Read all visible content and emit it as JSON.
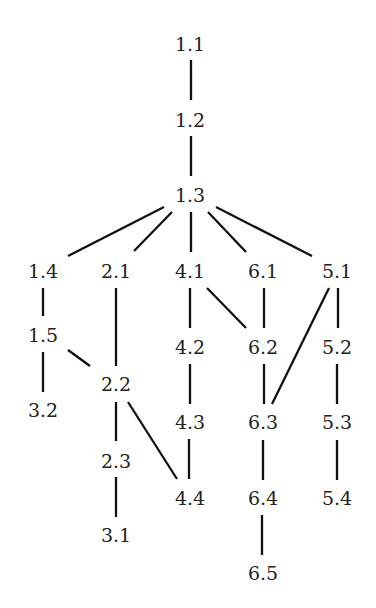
{
  "diagram": {
    "type": "hasse-diagram",
    "colors": {
      "line": "#111111",
      "text": "#222222",
      "background": "#ffffff"
    },
    "nodes": [
      {
        "id": "1.1",
        "label": "1.1",
        "x": 190,
        "y": 44
      },
      {
        "id": "1.2",
        "label": "1.2",
        "x": 190,
        "y": 120
      },
      {
        "id": "1.3",
        "label": "1.3",
        "x": 190,
        "y": 195
      },
      {
        "id": "1.4",
        "label": "1.4",
        "x": 43,
        "y": 271
      },
      {
        "id": "2.1",
        "label": "2.1",
        "x": 116,
        "y": 271
      },
      {
        "id": "4.1",
        "label": "4.1",
        "x": 190,
        "y": 271
      },
      {
        "id": "6.1",
        "label": "6.1",
        "x": 263,
        "y": 271
      },
      {
        "id": "5.1",
        "label": "5.1",
        "x": 337,
        "y": 271
      },
      {
        "id": "1.5",
        "label": "1.5",
        "x": 43,
        "y": 335
      },
      {
        "id": "4.2",
        "label": "4.2",
        "x": 190,
        "y": 347
      },
      {
        "id": "6.2",
        "label": "6.2",
        "x": 263,
        "y": 347
      },
      {
        "id": "5.2",
        "label": "5.2",
        "x": 337,
        "y": 347
      },
      {
        "id": "2.2",
        "label": "2.2",
        "x": 116,
        "y": 384
      },
      {
        "id": "3.2",
        "label": "3.2",
        "x": 43,
        "y": 410
      },
      {
        "id": "4.3",
        "label": "4.3",
        "x": 190,
        "y": 422
      },
      {
        "id": "6.3",
        "label": "6.3",
        "x": 263,
        "y": 422
      },
      {
        "id": "5.3",
        "label": "5.3",
        "x": 337,
        "y": 422
      },
      {
        "id": "2.3",
        "label": "2.3",
        "x": 116,
        "y": 461
      },
      {
        "id": "4.4",
        "label": "4.4",
        "x": 190,
        "y": 498
      },
      {
        "id": "6.4",
        "label": "6.4",
        "x": 263,
        "y": 498
      },
      {
        "id": "5.4",
        "label": "5.4",
        "x": 337,
        "y": 498
      },
      {
        "id": "3.1",
        "label": "3.1",
        "x": 116,
        "y": 535
      },
      {
        "id": "6.5",
        "label": "6.5",
        "x": 263,
        "y": 573
      }
    ],
    "edges": [
      {
        "from": "1.1",
        "to": "1.2",
        "x1": 191,
        "y1": 60,
        "x2": 191,
        "y2": 100
      },
      {
        "from": "1.2",
        "to": "1.3",
        "x1": 191,
        "y1": 136,
        "x2": 191,
        "y2": 176
      },
      {
        "from": "1.3",
        "to": "1.4",
        "x1": 164,
        "y1": 207,
        "x2": 68,
        "y2": 256
      },
      {
        "from": "1.3",
        "to": "2.1",
        "x1": 172,
        "y1": 212,
        "x2": 134,
        "y2": 251
      },
      {
        "from": "1.3",
        "to": "4.1",
        "x1": 191,
        "y1": 212,
        "x2": 191,
        "y2": 252
      },
      {
        "from": "1.3",
        "to": "6.1",
        "x1": 208,
        "y1": 212,
        "x2": 246,
        "y2": 252
      },
      {
        "from": "1.3",
        "to": "5.1",
        "x1": 216,
        "y1": 207,
        "x2": 312,
        "y2": 256
      },
      {
        "from": "1.4",
        "to": "1.5",
        "x1": 43,
        "y1": 288,
        "x2": 43,
        "y2": 316
      },
      {
        "from": "1.5",
        "to": "3.2",
        "x1": 43,
        "y1": 352,
        "x2": 43,
        "y2": 392
      },
      {
        "from": "1.5",
        "to": "2.2",
        "x1": 68,
        "y1": 350,
        "x2": 90,
        "y2": 366
      },
      {
        "from": "2.1",
        "to": "2.2",
        "x1": 116,
        "y1": 288,
        "x2": 116,
        "y2": 366
      },
      {
        "from": "2.2",
        "to": "2.3",
        "x1": 116,
        "y1": 402,
        "x2": 116,
        "y2": 441
      },
      {
        "from": "2.2",
        "to": "4.4",
        "x1": 128,
        "y1": 402,
        "x2": 177,
        "y2": 479
      },
      {
        "from": "2.3",
        "to": "3.1",
        "x1": 116,
        "y1": 477,
        "x2": 116,
        "y2": 517
      },
      {
        "from": "4.1",
        "to": "4.2",
        "x1": 190,
        "y1": 288,
        "x2": 190,
        "y2": 328
      },
      {
        "from": "4.1",
        "to": "6.2",
        "x1": 207,
        "y1": 288,
        "x2": 246,
        "y2": 328
      },
      {
        "from": "4.2",
        "to": "4.3",
        "x1": 190,
        "y1": 364,
        "x2": 190,
        "y2": 404
      },
      {
        "from": "4.3",
        "to": "4.4",
        "x1": 189,
        "y1": 439,
        "x2": 189,
        "y2": 479
      },
      {
        "from": "6.1",
        "to": "6.2",
        "x1": 264,
        "y1": 288,
        "x2": 264,
        "y2": 328
      },
      {
        "from": "6.2",
        "to": "6.3",
        "x1": 264,
        "y1": 364,
        "x2": 264,
        "y2": 404
      },
      {
        "from": "6.3",
        "to": "6.4",
        "x1": 263,
        "y1": 440,
        "x2": 263,
        "y2": 480
      },
      {
        "from": "6.4",
        "to": "6.5",
        "x1": 262,
        "y1": 515,
        "x2": 262,
        "y2": 555
      },
      {
        "from": "5.1",
        "to": "5.2",
        "x1": 338,
        "y1": 288,
        "x2": 338,
        "y2": 328
      },
      {
        "from": "5.1",
        "to": "6.3",
        "x1": 329,
        "y1": 288,
        "x2": 272,
        "y2": 404
      },
      {
        "from": "5.2",
        "to": "5.3",
        "x1": 337,
        "y1": 364,
        "x2": 337,
        "y2": 404
      },
      {
        "from": "5.3",
        "to": "5.4",
        "x1": 337,
        "y1": 440,
        "x2": 337,
        "y2": 480
      }
    ]
  }
}
